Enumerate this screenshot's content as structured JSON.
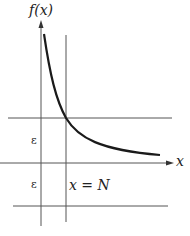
{
  "diagram": {
    "y_axis_label": "f(x)",
    "x_axis_label": "x",
    "vertical_line_label": "x = N",
    "epsilon_upper": "ε",
    "epsilon_lower": "ε",
    "colors": {
      "curve": "#1a1a1a",
      "lines": "#555555",
      "background": "#ffffff"
    }
  }
}
